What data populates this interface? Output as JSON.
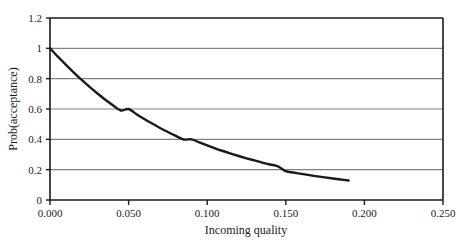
{
  "chart_data": {
    "type": "line",
    "title": "",
    "xlabel": "Incoming quality",
    "ylabel": "Prob(acceptance)",
    "xlim": [
      0.0,
      0.25
    ],
    "ylim": [
      0.0,
      1.2
    ],
    "grid": "horizontal",
    "legend": "none",
    "x_ticks": [
      "0.000",
      "0.050",
      "0.100",
      "0.150",
      "0.200",
      "0.250"
    ],
    "x_tick_values": [
      0.0,
      0.05,
      0.1,
      0.15,
      0.2,
      0.25
    ],
    "y_ticks": [
      "0",
      "0.2",
      "0.4",
      "0.6",
      "0.8",
      "1",
      "1.2"
    ],
    "y_tick_values": [
      0.0,
      0.2,
      0.4,
      0.6,
      0.8,
      1.0,
      1.2
    ],
    "series": [
      {
        "name": "Operating characteristic curve",
        "x": [
          0.0,
          0.005,
          0.01,
          0.015,
          0.02,
          0.025,
          0.03,
          0.035,
          0.04,
          0.045,
          0.05,
          0.055,
          0.06,
          0.065,
          0.07,
          0.075,
          0.08,
          0.085,
          0.09,
          0.095,
          0.1,
          0.105,
          0.11,
          0.115,
          0.12,
          0.125,
          0.13,
          0.135,
          0.14,
          0.145,
          0.15,
          0.155,
          0.16,
          0.165,
          0.17,
          0.175,
          0.18,
          0.185,
          0.19
        ],
        "y": [
          1.0,
          0.945,
          0.893,
          0.842,
          0.793,
          0.747,
          0.704,
          0.663,
          0.625,
          0.59,
          0.6,
          0.566,
          0.534,
          0.504,
          0.475,
          0.448,
          0.423,
          0.399,
          0.4,
          0.38,
          0.36,
          0.341,
          0.323,
          0.306,
          0.29,
          0.275,
          0.261,
          0.247,
          0.234,
          0.222,
          0.19,
          0.181,
          0.172,
          0.164,
          0.156,
          0.149,
          0.142,
          0.135,
          0.129
        ]
      }
    ],
    "colors": {
      "curve": "#1a1a1a",
      "gridline": "#808080",
      "axis": "#1a1a1a",
      "background": "#ffffff"
    }
  }
}
